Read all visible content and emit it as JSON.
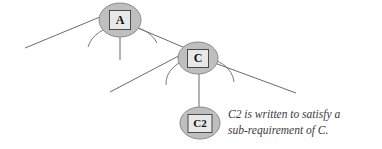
{
  "diagram": {
    "type": "tree-decomposition-diagram",
    "background_color": "#ffffff",
    "node_fill": "#bfbfbf",
    "node_stroke": "#8a8a8a",
    "box_fill": "#e8e8e8",
    "box_stroke": "#4a4a4a",
    "edge_color": "#6b6b6b",
    "arc_color": "#7a7a7a",
    "nodes": [
      {
        "id": "A",
        "label": "A",
        "cx": 120,
        "cy": 20,
        "rx": 21,
        "ry": 17,
        "box_w": 21,
        "box_h": 19,
        "font_size": 12
      },
      {
        "id": "C",
        "label": "C",
        "cx": 198,
        "cy": 58,
        "rx": 20,
        "ry": 16,
        "box_w": 21,
        "box_h": 18,
        "font_size": 12
      },
      {
        "id": "C2",
        "label": "C2",
        "cx": 200,
        "cy": 123,
        "rx": 20,
        "ry": 16,
        "box_w": 24,
        "box_h": 18,
        "font_size": 11
      }
    ],
    "edges": [
      {
        "name": "edge-a-left",
        "x1": 25,
        "y1": 48,
        "x2": 112,
        "y2": 12
      },
      {
        "name": "edge-a-down",
        "x1": 120,
        "y1": 28,
        "x2": 120,
        "y2": 60
      },
      {
        "name": "edge-a-to-c",
        "x1": 138,
        "y1": 28,
        "x2": 188,
        "y2": 50
      },
      {
        "name": "edge-c-left",
        "x1": 110,
        "y1": 92,
        "x2": 190,
        "y2": 50
      },
      {
        "name": "edge-c-down",
        "x1": 199,
        "y1": 66,
        "x2": 199,
        "y2": 110
      },
      {
        "name": "edge-c-right",
        "x1": 212,
        "y1": 62,
        "x2": 296,
        "y2": 93
      }
    ],
    "arcs": [
      {
        "name": "arc-under-a",
        "d": "M 88 47 A 36 27 0 0 1 157 43"
      },
      {
        "name": "arc-under-c",
        "d": "M 166 85 A 34 26 0 0 1 234 82"
      }
    ]
  },
  "annotation": {
    "name": "c2-annotation",
    "line1": "C2 is written to satisfy a",
    "line2": "sub-requirement of C."
  }
}
